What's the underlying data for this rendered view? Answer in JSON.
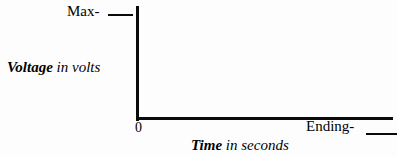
{
  "figure": {
    "type": "blank-axes-diagram",
    "background_color": "#fdfdfd",
    "ink_color": "#0a0a0a"
  },
  "y_axis": {
    "title_strong": "Voltage",
    "title_light": "in volts",
    "max_tick_label": "Max-",
    "origin_label": "0"
  },
  "x_axis": {
    "title_strong": "Time",
    "title_light": "in seconds",
    "end_tick_label": "Ending-"
  },
  "chart_data": {
    "type": "line",
    "title": "",
    "xlabel": "Time in seconds",
    "ylabel": "Voltage in volts",
    "x": [],
    "values": [],
    "series": [],
    "categories": [],
    "xlim": [
      0,
      null
    ],
    "ylim": [
      0,
      null
    ],
    "x_tick_labels": [
      "0",
      "Ending-"
    ],
    "y_tick_labels": [
      "Max-"
    ],
    "grid": false,
    "legend": false
  }
}
